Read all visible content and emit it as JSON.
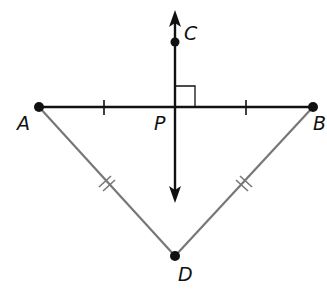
{
  "figure": {
    "type": "geometry-diagram",
    "points": {
      "A": {
        "label": "A",
        "x": 39,
        "y": 107
      },
      "B": {
        "label": "B",
        "x": 313,
        "y": 107
      },
      "P": {
        "label": "P",
        "x": 175,
        "y": 107
      },
      "C": {
        "label": "C",
        "x": 175,
        "y": 42
      },
      "D": {
        "label": "D",
        "x": 175,
        "y": 256
      }
    },
    "segments": [
      {
        "name": "AB",
        "color": "#111111",
        "marks": "single tick each half (AP = PB)"
      },
      {
        "name": "AD",
        "color": "#777777",
        "marks": "double tick"
      },
      {
        "name": "BD",
        "color": "#777777",
        "marks": "double tick"
      }
    ],
    "line_CP": {
      "arrows": "both ends",
      "perpendicular_to": "AB",
      "right_angle_at": "P"
    },
    "colors": {
      "primary": "#111111",
      "secondary": "#777777",
      "background": "#ffffff"
    }
  }
}
